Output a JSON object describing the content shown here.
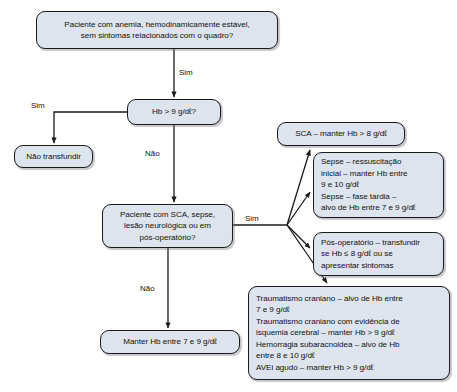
{
  "diagram": {
    "fill_color": "#dde4ed",
    "border_color": "#1b1b1b",
    "text_color": "#111111",
    "nodes": {
      "top": "Paciente com anemia, hemodinamicamente estável,\nsem sintomas relacionados com o quadro?",
      "hb": "Hb > 9 g/dℓ?",
      "no_transfundir": "Não transfundir",
      "mid": "Paciente com SCA, sepse,\nlesão neurológica ou em\npós-operatório?",
      "manter": "Manter Hb entre 7 e 9 g/dℓ",
      "sca": "SCA – manter Hb > 8 g/dℓ",
      "sepse": "Sepse – ressuscitação\ninicial – manter Hb entre\n9 e 10 g/dℓ\nSepse – fase tardia –\nalvo de Hb entre 7 e 9 g/dℓ",
      "pos_operatorio": "Pós-operatório – transfundir\nse Hb ≤ 8 g/dℓ ou se\napresentar sintomas",
      "trauma": "Traumatismo craniano – alvo de Hb entre\n7 e 9 g/dℓ\nTraumatismo craniano com evidência de\nisquemia cerebral – manter Hb > 9 g/dℓ\nHemorragia subaracnoidea – alvo de Hb\nentre 8 e 10 g/dℓ\nAVEi agudo – manter Hb > 9 g/dℓ"
    },
    "edge_labels": {
      "top_to_hb": "Sim",
      "hb_yes": "Sim",
      "hb_no": "Não",
      "mid_yes": "Sim",
      "mid_no": "Não"
    }
  }
}
